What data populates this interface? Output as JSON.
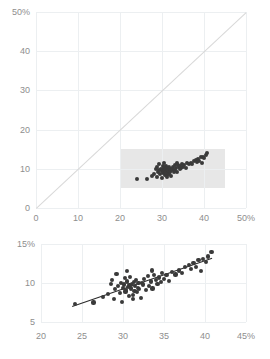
{
  "chart_data": [
    {
      "id": "overview",
      "type": "scatter",
      "title": "",
      "xlabel": "",
      "ylabel": "",
      "xlim": [
        0,
        50
      ],
      "ylim": [
        0,
        50
      ],
      "xticks": [
        0,
        10,
        20,
        30,
        40,
        50
      ],
      "yticks": [
        0,
        10,
        20,
        30,
        40,
        50
      ],
      "xticklabels": [
        "0",
        "10",
        "20",
        "30",
        "40",
        "50%"
      ],
      "yticklabels": [
        "0",
        "10",
        "20",
        "30",
        "40",
        "50%"
      ],
      "grid": true,
      "legend": "none",
      "annotations": [
        {
          "kind": "reference-line",
          "name": "identity-line",
          "from": [
            0,
            0
          ],
          "to": [
            50,
            50
          ],
          "color": "#d8d8d8"
        },
        {
          "kind": "highlight-rect",
          "name": "detail-region",
          "x0": 20,
          "x1": 45,
          "y0": 5,
          "y1": 15,
          "color": "#e3e3e3"
        }
      ],
      "points": [
        [
          24.1,
          7.3
        ],
        [
          26.4,
          7.5
        ],
        [
          27.6,
          8.2
        ],
        [
          28.2,
          8.6
        ],
        [
          28.5,
          9.9
        ],
        [
          28.7,
          10.4
        ],
        [
          28.9,
          8.0
        ],
        [
          29.0,
          9.2
        ],
        [
          29.2,
          11.2
        ],
        [
          29.4,
          9.6
        ],
        [
          29.6,
          8.7
        ],
        [
          29.8,
          10.0
        ],
        [
          29.9,
          7.6
        ],
        [
          30.0,
          9.4
        ],
        [
          30.1,
          9.8
        ],
        [
          30.2,
          10.6
        ],
        [
          30.3,
          8.9
        ],
        [
          30.4,
          9.1
        ],
        [
          30.5,
          10.2
        ],
        [
          30.6,
          9.5
        ],
        [
          30.7,
          8.3
        ],
        [
          30.8,
          9.7
        ],
        [
          30.9,
          10.8
        ],
        [
          31.0,
          9.3
        ],
        [
          31.1,
          9.9
        ],
        [
          31.2,
          8.5
        ],
        [
          31.3,
          10.1
        ],
        [
          31.4,
          9.0
        ],
        [
          31.5,
          9.6
        ],
        [
          31.6,
          10.4
        ],
        [
          31.7,
          8.8
        ],
        [
          31.8,
          9.4
        ],
        [
          31.9,
          10.0
        ],
        [
          32.0,
          9.2
        ],
        [
          32.2,
          8.1
        ],
        [
          32.4,
          9.8
        ],
        [
          32.6,
          10.5
        ],
        [
          32.8,
          9.1
        ],
        [
          33.0,
          10.9
        ],
        [
          33.2,
          9.6
        ],
        [
          33.4,
          10.2
        ],
        [
          33.6,
          9.3
        ],
        [
          33.8,
          11.0
        ],
        [
          34.0,
          10.4
        ],
        [
          34.2,
          9.9
        ],
        [
          34.4,
          10.7
        ],
        [
          34.6,
          10.1
        ],
        [
          34.8,
          11.3
        ],
        [
          35.0,
          10.5
        ],
        [
          35.3,
          11.0
        ],
        [
          35.6,
          10.3
        ],
        [
          36.0,
          11.4
        ],
        [
          36.4,
          11.1
        ],
        [
          36.8,
          11.6
        ],
        [
          37.2,
          11.3
        ],
        [
          37.6,
          12.0
        ],
        [
          38.0,
          12.3
        ],
        [
          38.3,
          11.8
        ],
        [
          38.6,
          12.6
        ],
        [
          38.9,
          12.1
        ],
        [
          39.2,
          12.9
        ],
        [
          39.5,
          11.5
        ],
        [
          39.8,
          13.1
        ],
        [
          40.1,
          12.7
        ],
        [
          40.4,
          13.4
        ],
        [
          40.8,
          14.0
        ],
        [
          33.5,
          11.6
        ],
        [
          30.5,
          11.5
        ],
        [
          32.3,
          10.0
        ],
        [
          31.2,
          7.9
        ]
      ]
    },
    {
      "id": "detail",
      "type": "scatter",
      "title": "",
      "xlabel": "",
      "ylabel": "",
      "xlim": [
        20,
        45
      ],
      "ylim": [
        5,
        15
      ],
      "xticks": [
        20,
        25,
        30,
        35,
        40,
        45
      ],
      "yticks": [
        5,
        10,
        15
      ],
      "xticklabels": [
        "20",
        "25",
        "30",
        "35",
        "40",
        "45%"
      ],
      "yticklabels": [
        "5",
        "10",
        "15%"
      ],
      "grid": true,
      "legend": "none",
      "annotations": [
        {
          "kind": "trend-line",
          "name": "fit-line",
          "from": [
            23.8,
            7.1
          ],
          "to": [
            40.9,
            13.3
          ],
          "color": "#2b2b2b"
        }
      ],
      "points": [
        [
          24.1,
          7.3
        ],
        [
          26.4,
          7.5
        ],
        [
          27.6,
          8.2
        ],
        [
          28.2,
          8.6
        ],
        [
          28.5,
          9.9
        ],
        [
          28.7,
          10.4
        ],
        [
          28.9,
          8.0
        ],
        [
          29.0,
          9.2
        ],
        [
          29.2,
          11.2
        ],
        [
          29.4,
          9.6
        ],
        [
          29.6,
          8.7
        ],
        [
          29.8,
          10.0
        ],
        [
          29.9,
          7.6
        ],
        [
          30.0,
          9.4
        ],
        [
          30.1,
          9.8
        ],
        [
          30.2,
          10.6
        ],
        [
          30.3,
          8.9
        ],
        [
          30.4,
          9.1
        ],
        [
          30.5,
          10.2
        ],
        [
          30.6,
          9.5
        ],
        [
          30.7,
          8.3
        ],
        [
          30.8,
          9.7
        ],
        [
          30.9,
          10.8
        ],
        [
          31.0,
          9.3
        ],
        [
          31.1,
          9.9
        ],
        [
          31.2,
          8.5
        ],
        [
          31.3,
          10.1
        ],
        [
          31.4,
          9.0
        ],
        [
          31.5,
          9.6
        ],
        [
          31.6,
          10.4
        ],
        [
          31.7,
          8.8
        ],
        [
          31.8,
          9.4
        ],
        [
          31.9,
          10.0
        ],
        [
          32.0,
          9.2
        ],
        [
          32.2,
          8.1
        ],
        [
          32.4,
          9.8
        ],
        [
          32.6,
          10.5
        ],
        [
          32.8,
          9.1
        ],
        [
          33.0,
          10.9
        ],
        [
          33.2,
          9.6
        ],
        [
          33.4,
          10.2
        ],
        [
          33.6,
          9.3
        ],
        [
          33.8,
          11.0
        ],
        [
          34.0,
          10.4
        ],
        [
          34.2,
          9.9
        ],
        [
          34.4,
          10.7
        ],
        [
          34.6,
          10.1
        ],
        [
          34.8,
          11.3
        ],
        [
          35.0,
          10.5
        ],
        [
          35.3,
          11.0
        ],
        [
          35.6,
          10.3
        ],
        [
          36.0,
          11.4
        ],
        [
          36.4,
          11.1
        ],
        [
          36.8,
          11.6
        ],
        [
          37.2,
          11.3
        ],
        [
          37.6,
          12.0
        ],
        [
          38.0,
          12.3
        ],
        [
          38.3,
          11.8
        ],
        [
          38.6,
          12.6
        ],
        [
          38.9,
          12.1
        ],
        [
          39.2,
          12.9
        ],
        [
          39.5,
          11.5
        ],
        [
          39.8,
          13.1
        ],
        [
          40.1,
          12.7
        ],
        [
          40.4,
          13.4
        ],
        [
          40.8,
          14.0
        ],
        [
          33.5,
          11.6
        ],
        [
          30.5,
          11.5
        ],
        [
          32.3,
          10.0
        ],
        [
          31.2,
          7.9
        ]
      ]
    }
  ],
  "colors": {
    "point": "#3a3a3a",
    "grid": "#eceff1",
    "reference_line": "#d8d8d8",
    "trend_line": "#2b2b2b",
    "highlight": "#e3e3e3",
    "tick_label": "#8e8e8e"
  }
}
